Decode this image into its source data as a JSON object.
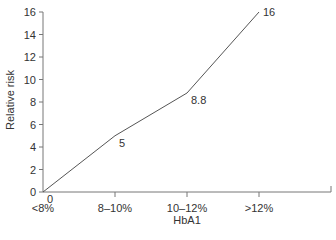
{
  "chart_data": {
    "type": "line",
    "title": "",
    "xlabel": "HbA1",
    "ylabel": "Relative risk",
    "categories": [
      "<8%",
      "8–10%",
      "10–12%",
      ">12%"
    ],
    "values": [
      0,
      5,
      8.8,
      16
    ],
    "data_labels": [
      "0",
      "5",
      "8.8",
      "16"
    ],
    "ylim": [
      0,
      16
    ],
    "yticks": [
      "0",
      "2",
      "4",
      "6",
      "8",
      "10",
      "12",
      "14",
      "16"
    ],
    "grid": false,
    "legend": null
  },
  "colors": {
    "line": "#555555",
    "axis": "#777777",
    "text": "#333333"
  }
}
